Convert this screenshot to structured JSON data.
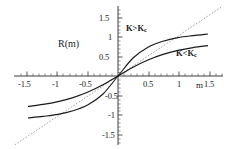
{
  "chart_data": {
    "type": "line",
    "title": "",
    "xlabel": "m",
    "ylabel": "R(m)",
    "xlim": [
      -1.75,
      1.75
    ],
    "ylim": [
      -1.75,
      1.75
    ],
    "grid": false,
    "legend_position": "inline-annotations",
    "xticks": [
      -1.5,
      -1,
      -0.5,
      0.5,
      1,
      1.5
    ],
    "xtick_labels": [
      "-1.5",
      "-1",
      "-0.5",
      "0.5",
      "1",
      "1.5"
    ],
    "yticks": [
      -1.5,
      -1,
      -0.5,
      0.5,
      1,
      1.5
    ],
    "ytick_labels": [
      "-1.5",
      "-1",
      "-0.5",
      "0.5",
      "1",
      "1.5"
    ],
    "series": [
      {
        "name": "K>K_c",
        "style": "solid",
        "annotation": "K>K",
        "annotation_sub": "c",
        "description": "steep sigmoid, slope at origin greater than 1, crosses y=x near m=1",
        "x": [
          -1.5,
          -1.25,
          -1.0,
          -0.75,
          -0.5,
          -0.25,
          0,
          0.25,
          0.5,
          0.75,
          1.0,
          1.25,
          1.5
        ],
        "y": [
          -1.05,
          -1.01,
          -0.96,
          -0.87,
          -0.72,
          -0.45,
          0,
          0.45,
          0.72,
          0.87,
          0.96,
          1.01,
          1.05
        ]
      },
      {
        "name": "K<K_c",
        "style": "solid",
        "annotation": "K<K",
        "annotation_sub": "c",
        "description": "shallow sigmoid, slope at origin less than 1, stays below y=x for m>0",
        "x": [
          -1.5,
          -1.25,
          -1.0,
          -0.75,
          -0.5,
          -0.25,
          0,
          0.25,
          0.5,
          0.75,
          1.0,
          1.25,
          1.5
        ],
        "y": [
          -0.76,
          -0.71,
          -0.64,
          -0.54,
          -0.4,
          -0.22,
          0,
          0.22,
          0.4,
          0.54,
          0.64,
          0.71,
          0.76
        ]
      },
      {
        "name": "y=x",
        "style": "dashed",
        "annotation": "",
        "annotation_sub": "",
        "description": "dashed diagonal reference line through origin with unit slope",
        "x": [
          -1.72,
          1.72
        ],
        "y": [
          -1.72,
          1.72
        ]
      }
    ]
  },
  "colors": {
    "axis": "#2b2b2b",
    "curve": "#1a1a1a",
    "dashed": "#8c8c8c",
    "text": "#1a1a1a",
    "background": "#ffffff"
  },
  "labels": {
    "y_axis_name": "R(m)",
    "x_axis_name": "m",
    "annotation_super_main": "K>K",
    "annotation_super_sub": "c",
    "annotation_sub_main": "K<K",
    "annotation_sub_sub": "c",
    "x_tick_neg_1_5": "-1.5",
    "x_tick_neg_1": "-1",
    "x_tick_neg_0_5": "-0.5",
    "x_tick_pos_0_5": "0.5",
    "x_tick_pos_1": "1",
    "x_tick_pos_1_5": "1.5",
    "y_tick_pos_1_5": "1.5",
    "y_tick_pos_1": "1",
    "y_tick_pos_0_5": "0.5",
    "y_tick_neg_0_5": "-0.5",
    "y_tick_neg_1": "-1",
    "y_tick_neg_1_5": "-1.5"
  }
}
